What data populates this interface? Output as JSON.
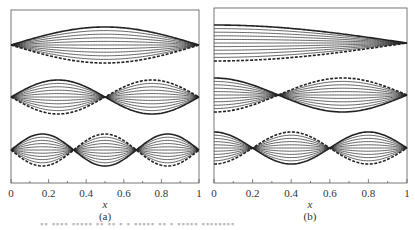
{
  "chart_data": [
    {
      "type": "line",
      "panel_label": "(a)",
      "title": "",
      "xlabel": "x",
      "ylabel": "",
      "xlim": [
        0,
        1
      ],
      "xticks": [
        "0",
        "0.2",
        "0.4",
        "0.6",
        "0.8",
        "1"
      ],
      "grid": false,
      "description": "Three stacked mode shapes with both ends fixed (nodes at x=0 and x=1); each mode drawn as a family of scaled curves (solid outermost positive, dashed outermost negative).",
      "series": [
        {
          "name": "mode 1",
          "shape": "sin(pi*x)",
          "nodes": [
            0,
            1
          ]
        },
        {
          "name": "mode 2",
          "shape": "sin(2*pi*x)",
          "nodes": [
            0,
            0.5,
            1
          ]
        },
        {
          "name": "mode 3",
          "shape": "sin(3*pi*x)",
          "nodes": [
            0,
            0.333,
            0.667,
            1
          ]
        }
      ],
      "amplitude_scales": [
        1.0,
        0.8,
        0.6,
        0.4,
        0.2,
        0.0,
        -0.2,
        -0.4,
        -0.6,
        -0.8,
        -1.0
      ]
    },
    {
      "type": "line",
      "panel_label": "(b)",
      "title": "",
      "xlabel": "x",
      "ylabel": "",
      "xlim": [
        0,
        1
      ],
      "xticks": [
        "0",
        "0.2",
        "0.4",
        "0.6",
        "0.8",
        "1"
      ],
      "grid": false,
      "description": "Three stacked mode shapes with free end at x=0 and fixed end at x=1; each mode drawn as a family of scaled curves (solid outermost positive, dashed outermost negative).",
      "series": [
        {
          "name": "mode 1",
          "shape": "cos(pi*x/2)",
          "nodes": [
            1
          ]
        },
        {
          "name": "mode 2",
          "shape": "cos(3*pi*x/2)",
          "nodes": [
            0.333,
            1
          ]
        },
        {
          "name": "mode 3",
          "shape": "cos(5*pi*x/2)",
          "nodes": [
            0.2,
            0.6,
            1
          ]
        }
      ],
      "amplitude_scales": [
        1.0,
        0.8,
        0.6,
        0.4,
        0.2,
        0.0,
        -0.2,
        -0.4,
        -0.6,
        -0.8,
        -1.0
      ]
    }
  ],
  "panels": {
    "a": {
      "label": "(a)",
      "xlabel": "x",
      "ticks": [
        "0",
        "0.2",
        "0.4",
        "0.6",
        "0.8",
        "1"
      ]
    },
    "b": {
      "label": "(b)",
      "xlabel": "x",
      "ticks": [
        "0",
        "0.2",
        "0.4",
        "0.6",
        "0.8",
        "1"
      ]
    }
  },
  "colors": {
    "frame": "#555555",
    "curve": "#222222",
    "text": "#333333"
  }
}
